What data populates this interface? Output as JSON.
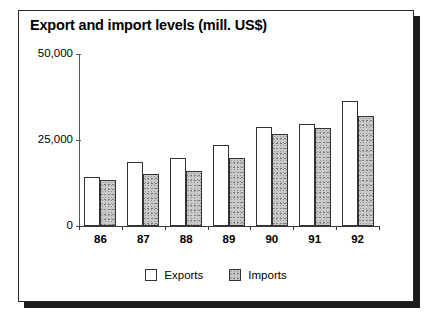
{
  "chart_data": {
    "type": "bar",
    "title": "Export and import levels (mill. US$)",
    "xlabel": "",
    "ylabel": "",
    "categories": [
      "86",
      "87",
      "88",
      "89",
      "90",
      "91",
      "92"
    ],
    "series": [
      {
        "name": "Exports",
        "values": [
          14200,
          18600,
          19800,
          23500,
          28800,
          29600,
          36300
        ],
        "color": "#ffffff"
      },
      {
        "name": "Imports",
        "values": [
          13400,
          15100,
          16000,
          19800,
          26700,
          28500,
          32000
        ],
        "color": "#c9c9c9"
      }
    ],
    "ylim": [
      0,
      50000
    ],
    "yticks": [
      0,
      25000,
      50000
    ],
    "ytick_labels": [
      "0",
      "25,000",
      "50,000"
    ],
    "grid": false,
    "legend_position": "bottom-center"
  },
  "legend": {
    "items": [
      {
        "label": "Exports",
        "swatch": "exports"
      },
      {
        "label": "Imports",
        "swatch": "imports"
      }
    ]
  }
}
